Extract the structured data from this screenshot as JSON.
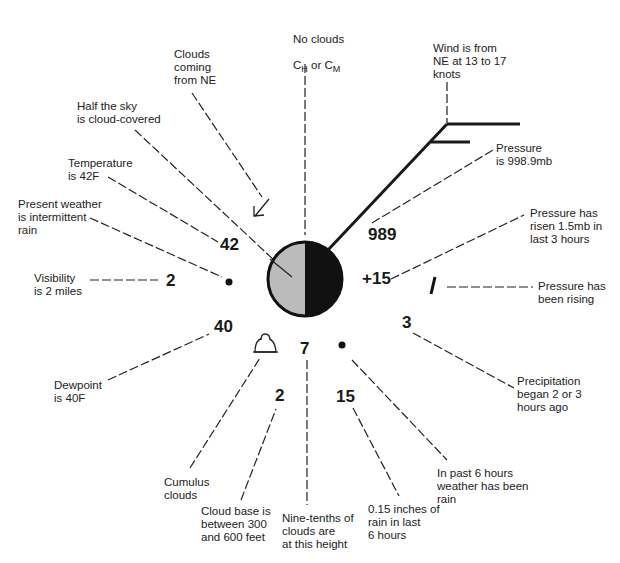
{
  "diagram": {
    "station": {
      "cloud_cover": "Half the sky is cloud-covered",
      "fill_left": "#bbbbbb",
      "fill_right": "#111111"
    },
    "values": {
      "temperature": "42",
      "visibility": "2",
      "dewpoint": "40",
      "pressure": "989",
      "pressure_change": "+15",
      "pressure_tendency_symbol": "/",
      "precip_time": "3",
      "low_cloud_amount": "7",
      "cloud_base": "2",
      "precip_amount": "15"
    },
    "labels": {
      "no_clouds_line1": "No clouds",
      "no_clouds_ch": "C",
      "no_clouds_ch_sub": "H",
      "no_clouds_or": " or ",
      "no_clouds_cm": "C",
      "no_clouds_cm_sub": "M",
      "clouds_coming": "Clouds\ncoming\nfrom NE",
      "half_sky": "Half the sky\nis cloud-covered",
      "temperature": "Temperature\nis 42F",
      "present_weather": "Present weather\nis intermittent\nrain",
      "visibility": "Visibility\nis 2 miles",
      "dewpoint": "Dewpoint\nis 40F",
      "cumulus": "Cumulus\nclouds",
      "cloud_base": "Cloud base is\nbetween 300\nand 600 feet",
      "nine_tenths": "Nine-tenths of\nclouds are\nat this height",
      "rain_amount": "0.15 inches of\nrain in last\n6 hours",
      "past_weather": "In past 6 hours\nweather has been\nrain",
      "precip_began": "Precipitation\nbegan 2 or 3\nhours ago",
      "pressure_rising": "Pressure has\nbeen rising",
      "pressure_risen": "Pressure has\nrisen 1.5mb in\nlast 3 hours",
      "pressure": "Pressure\nis 998.9mb",
      "wind": "Wind is from\nNE at 13 to 17\nknots"
    }
  }
}
